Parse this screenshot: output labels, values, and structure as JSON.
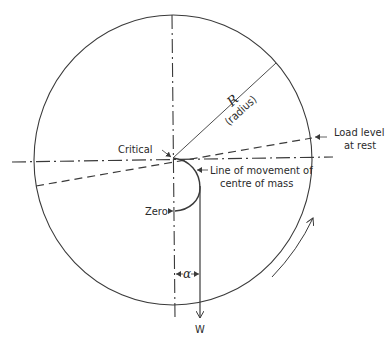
{
  "diagram": {
    "type": "mechanics-diagram",
    "labels": {
      "radius_symbol": "R",
      "radius_text": "(radius)",
      "critical": "Critical",
      "load_level_line1": "Load level",
      "load_level_line2": "at rest",
      "line_movement_line1": "Line of movement of",
      "line_movement_line2": "centre of mass",
      "zero": "Zero",
      "alpha": "α",
      "weight": "W"
    },
    "elements": [
      {
        "name": "drum-circle",
        "kind": "circle",
        "center": [
          173,
          160
        ],
        "rx": 139,
        "ry": 145
      },
      {
        "name": "horizontal-centerline",
        "kind": "dash-dot line"
      },
      {
        "name": "vertical-centerline",
        "kind": "dash-dot line"
      },
      {
        "name": "radius-line",
        "kind": "solid line",
        "label": "R (radius)"
      },
      {
        "name": "load-level-line",
        "kind": "dashed line",
        "label": "Load level at rest"
      },
      {
        "name": "centre-of-mass-path",
        "kind": "arc",
        "from": "Critical",
        "to": "Zero"
      },
      {
        "name": "weight-vector",
        "kind": "arrow",
        "label": "W"
      },
      {
        "name": "alpha-dimension",
        "kind": "dimension",
        "label": "α"
      },
      {
        "name": "rotation-arrow",
        "kind": "curved arrow",
        "direction": "counter-clockwise"
      }
    ],
    "colors": {
      "stroke": "#3a3a3a",
      "background": "#ffffff"
    }
  }
}
